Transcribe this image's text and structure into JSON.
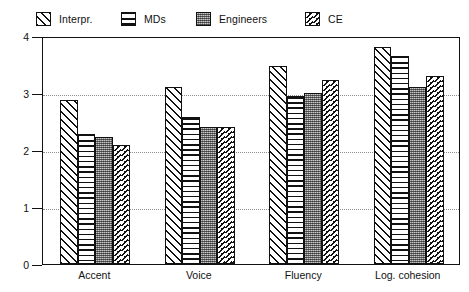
{
  "chart_data": {
    "type": "bar",
    "title": "",
    "xlabel": "",
    "ylabel": "",
    "ylim": [
      0,
      4
    ],
    "yticks": [
      0,
      1,
      2,
      3,
      4
    ],
    "ytick_labels": [
      "0",
      "1",
      "2",
      "3",
      "4"
    ],
    "grid": "horizontal dotted gridlines at 1, 2, 3",
    "legend_position": "top",
    "categories": [
      "Accent",
      "Voice",
      "Fluency",
      "Log. cohesion"
    ],
    "series": [
      {
        "name": "Interpr.",
        "pattern": "diagonal-hatch",
        "values": [
          2.88,
          3.1,
          3.48,
          3.8
        ]
      },
      {
        "name": "MDs",
        "pattern": "horizontal-lines",
        "values": [
          2.28,
          2.58,
          2.95,
          3.65
        ]
      },
      {
        "name": "Engineers",
        "pattern": "dense-dots-gray",
        "values": [
          2.22,
          2.4,
          3.0,
          3.1
        ]
      },
      {
        "name": "CE",
        "pattern": "sparse-diagonal-dashes",
        "values": [
          2.08,
          2.4,
          3.22,
          3.3
        ]
      }
    ]
  },
  "legend": {
    "items": [
      {
        "label": "Interpr.",
        "swatch": "diagonal-hatch-swatch"
      },
      {
        "label": "MDs",
        "swatch": "horizontal-lines-swatch"
      },
      {
        "label": "Engineers",
        "swatch": "dense-dots-swatch"
      },
      {
        "label": "CE",
        "swatch": "sparse-dash-swatch"
      }
    ]
  },
  "axis": {
    "y_tick_labels": [
      "4",
      "3",
      "2",
      "1",
      "0"
    ],
    "x_tick_labels": [
      "Accent",
      "Voice",
      "Fluency",
      "Log. cohesion"
    ]
  },
  "colors": {
    "ink": "#111111",
    "grid": "#8d8d8d",
    "engineers_fill": "#8c8c8c",
    "background": "#ffffff"
  }
}
